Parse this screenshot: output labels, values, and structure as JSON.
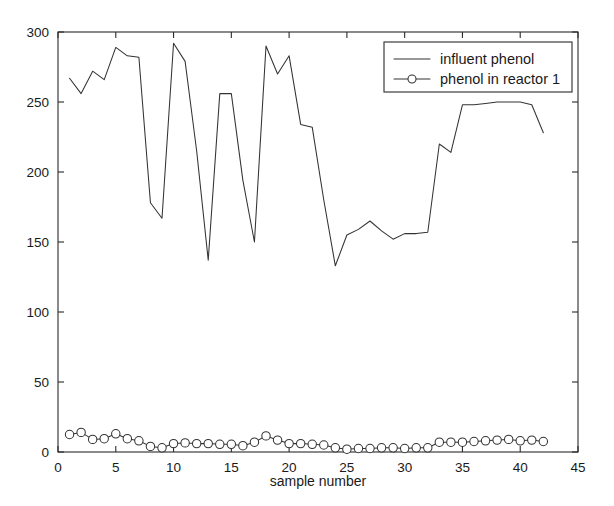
{
  "chart_data": {
    "type": "line",
    "title": "",
    "xlabel": "sample number",
    "ylabel": "",
    "xlim": [
      0,
      45
    ],
    "ylim": [
      0,
      300
    ],
    "xticks": [
      0,
      5,
      10,
      15,
      20,
      25,
      30,
      35,
      40,
      45
    ],
    "yticks": [
      0,
      50,
      100,
      150,
      200,
      250,
      300
    ],
    "xtick_labels": [
      "0",
      "5",
      "10",
      "15",
      "20",
      "25",
      "30",
      "35",
      "40",
      "45"
    ],
    "ytick_labels": [
      "0",
      "50",
      "100",
      "150",
      "200",
      "250",
      "300"
    ],
    "grid": false,
    "legend_position": "upper right",
    "x": [
      1,
      2,
      3,
      4,
      5,
      6,
      7,
      8,
      9,
      10,
      11,
      12,
      13,
      14,
      15,
      16,
      17,
      18,
      19,
      20,
      21,
      22,
      23,
      24,
      25,
      26,
      27,
      28,
      29,
      30,
      31,
      32,
      33,
      34,
      35,
      36,
      37,
      38,
      39,
      40,
      41,
      42
    ],
    "series": [
      {
        "name": "influent phenol",
        "marker": "none",
        "color": "#333333",
        "values": [
          267,
          256,
          272,
          266,
          289,
          283,
          282,
          178,
          167,
          292,
          279,
          215,
          137,
          256,
          256,
          194,
          150,
          290,
          270,
          283,
          234,
          232,
          180,
          133,
          155,
          159,
          165,
          158,
          152,
          156,
          156,
          157,
          220,
          214,
          248,
          248,
          249,
          250,
          250,
          250,
          248,
          228
        ]
      },
      {
        "name": "phenol in reactor 1",
        "marker": "circle",
        "color": "#333333",
        "values": [
          12.5,
          14.0,
          9.0,
          9.5,
          13.0,
          9.5,
          8.0,
          4.0,
          3.0,
          6.0,
          6.5,
          6.0,
          6.0,
          5.5,
          5.5,
          4.5,
          7.0,
          11.5,
          8.5,
          6.0,
          6.0,
          5.5,
          5.0,
          3.0,
          2.0,
          2.5,
          2.5,
          3.0,
          3.0,
          2.5,
          3.0,
          3.0,
          7.0,
          7.0,
          7.0,
          7.5,
          8.0,
          8.5,
          9.0,
          8.0,
          8.5,
          7.5
        ]
      }
    ]
  },
  "legend": {
    "entries": [
      {
        "label": "influent phenol",
        "sample": "plain-line"
      },
      {
        "label": "phenol in reactor 1",
        "sample": "line-with-circle"
      }
    ]
  },
  "axes": {
    "x_title": "sample number"
  }
}
